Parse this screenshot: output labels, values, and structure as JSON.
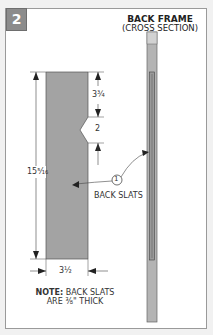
{
  "figure": {
    "step_number": "2",
    "title": "BACK FRAME",
    "subtitle": "(CROSS SECTION)"
  },
  "dimensions": {
    "overall_length": "15⁵⁄₁₆",
    "top_to_notch": "3¾",
    "notch_width": "2",
    "slat_width": "3½"
  },
  "callout": {
    "number": "1",
    "label": "BACK SLATS"
  },
  "note": {
    "prefix": "NOTE:",
    "line1": "BACK SLATS",
    "line2": "ARE ⅜\" THICK"
  },
  "colors": {
    "badge": "#8c8c8c",
    "part_fill": "#a3a3a3",
    "frame_border": "#9a9a9a",
    "line": "#333333"
  }
}
